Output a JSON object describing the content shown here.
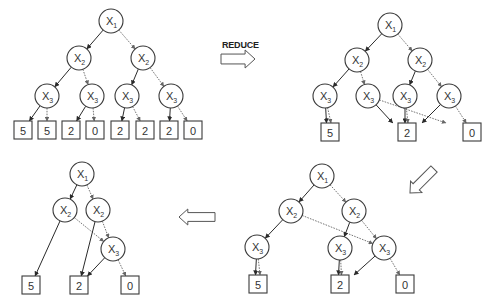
{
  "labels": {
    "reduce": "REDUCE"
  },
  "colors": {
    "stroke": "#3a3a3a",
    "dotted": "#666666",
    "background": "#ffffff"
  },
  "trees": [
    {
      "id": "original-tree",
      "nodes": [
        {
          "id": "a1",
          "var": "X",
          "sub": "1",
          "x": 111,
          "y": 21
        },
        {
          "id": "a2",
          "var": "X",
          "sub": "2",
          "x": 79,
          "y": 58
        },
        {
          "id": "a3",
          "var": "X",
          "sub": "2",
          "x": 143,
          "y": 58
        },
        {
          "id": "a4",
          "var": "X",
          "sub": "3",
          "x": 47,
          "y": 96
        },
        {
          "id": "a5",
          "var": "X",
          "sub": "3",
          "x": 92,
          "y": 96
        },
        {
          "id": "a6",
          "var": "X",
          "sub": "3",
          "x": 127,
          "y": 96
        },
        {
          "id": "a7",
          "var": "X",
          "sub": "3",
          "x": 171,
          "y": 96
        }
      ],
      "leaves": [
        {
          "id": "aL1",
          "value": "5",
          "x": 23,
          "y": 130
        },
        {
          "id": "aL2",
          "value": "5",
          "x": 47,
          "y": 130
        },
        {
          "id": "aL3",
          "value": "2",
          "x": 71,
          "y": 130
        },
        {
          "id": "aL4",
          "value": "0",
          "x": 95,
          "y": 130
        },
        {
          "id": "aL5",
          "value": "2",
          "x": 120,
          "y": 130
        },
        {
          "id": "aL6",
          "value": "2",
          "x": 145,
          "y": 130
        },
        {
          "id": "aL7",
          "value": "2",
          "x": 169,
          "y": 130
        },
        {
          "id": "aL8",
          "value": "0",
          "x": 193,
          "y": 130
        }
      ],
      "edges": [
        {
          "from": "a1",
          "to": "a2",
          "style": "solid"
        },
        {
          "from": "a1",
          "to": "a3",
          "style": "dotted"
        },
        {
          "from": "a2",
          "to": "a4",
          "style": "solid"
        },
        {
          "from": "a2",
          "to": "a5",
          "style": "dotted"
        },
        {
          "from": "a3",
          "to": "a6",
          "style": "solid"
        },
        {
          "from": "a3",
          "to": "a7",
          "style": "dotted"
        },
        {
          "from": "a4",
          "to": "aL1",
          "style": "solid"
        },
        {
          "from": "a4",
          "to": "aL2",
          "style": "dotted"
        },
        {
          "from": "a5",
          "to": "aL3",
          "style": "solid"
        },
        {
          "from": "a5",
          "to": "aL4",
          "style": "dotted"
        },
        {
          "from": "a6",
          "to": "aL5",
          "style": "solid"
        },
        {
          "from": "a6",
          "to": "aL6",
          "style": "dotted"
        },
        {
          "from": "a7",
          "to": "aL7",
          "style": "solid"
        },
        {
          "from": "a7",
          "to": "aL8",
          "style": "dotted"
        }
      ]
    },
    {
      "id": "merged-terminals-tree",
      "nodes": [
        {
          "id": "b1",
          "var": "X",
          "sub": "1",
          "x": 390,
          "y": 25
        },
        {
          "id": "b2",
          "var": "X",
          "sub": "2",
          "x": 357,
          "y": 60
        },
        {
          "id": "b3",
          "var": "X",
          "sub": "2",
          "x": 420,
          "y": 60
        },
        {
          "id": "b4",
          "var": "X",
          "sub": "3",
          "x": 325,
          "y": 96
        },
        {
          "id": "b5",
          "var": "X",
          "sub": "3",
          "x": 368,
          "y": 96
        },
        {
          "id": "b6",
          "var": "X",
          "sub": "3",
          "x": 405,
          "y": 96
        },
        {
          "id": "b7",
          "var": "X",
          "sub": "3",
          "x": 449,
          "y": 96
        }
      ],
      "leaves": [
        {
          "id": "bL1",
          "value": "5",
          "x": 330,
          "y": 132
        },
        {
          "id": "bL2",
          "value": "2",
          "x": 407,
          "y": 132
        },
        {
          "id": "bL3",
          "value": "0",
          "x": 472,
          "y": 132
        }
      ],
      "edges": [
        {
          "from": "b1",
          "to": "b2",
          "style": "solid"
        },
        {
          "from": "b1",
          "to": "b3",
          "style": "dotted"
        },
        {
          "from": "b2",
          "to": "b4",
          "style": "solid"
        },
        {
          "from": "b2",
          "to": "b5",
          "style": "dotted"
        },
        {
          "from": "b3",
          "to": "b6",
          "style": "solid"
        },
        {
          "from": "b3",
          "to": "b7",
          "style": "dotted"
        },
        {
          "from": "b4",
          "to": "bL1",
          "style": "solid",
          "dx": -3
        },
        {
          "from": "b4",
          "to": "bL1",
          "style": "dotted",
          "dx": 3
        },
        {
          "from": "b5",
          "to": "bL2",
          "style": "solid",
          "dx": -6
        },
        {
          "from": "b5",
          "to": "bL3",
          "style": "dotted"
        },
        {
          "from": "b6",
          "to": "bL2",
          "style": "solid",
          "dx": -2
        },
        {
          "from": "b6",
          "to": "bL2",
          "style": "dotted",
          "dx": 2
        },
        {
          "from": "b7",
          "to": "bL2",
          "style": "solid",
          "dx": 6
        },
        {
          "from": "b7",
          "to": "bL3",
          "style": "dotted"
        }
      ]
    },
    {
      "id": "merged-x3-tree",
      "nodes": [
        {
          "id": "c1",
          "var": "X",
          "sub": "1",
          "x": 322,
          "y": 176
        },
        {
          "id": "c2",
          "var": "X",
          "sub": "2",
          "x": 291,
          "y": 211
        },
        {
          "id": "c3",
          "var": "X",
          "sub": "2",
          "x": 354,
          "y": 211
        },
        {
          "id": "c4",
          "var": "X",
          "sub": "3",
          "x": 257,
          "y": 247
        },
        {
          "id": "c5",
          "var": "X",
          "sub": "3",
          "x": 340,
          "y": 248
        },
        {
          "id": "c6",
          "var": "X",
          "sub": "3",
          "x": 384,
          "y": 248
        }
      ],
      "leaves": [
        {
          "id": "cL1",
          "value": "5",
          "x": 258,
          "y": 284
        },
        {
          "id": "cL2",
          "value": "2",
          "x": 340,
          "y": 284
        },
        {
          "id": "cL3",
          "value": "0",
          "x": 405,
          "y": 284
        }
      ],
      "edges": [
        {
          "from": "c1",
          "to": "c2",
          "style": "solid"
        },
        {
          "from": "c1",
          "to": "c3",
          "style": "dotted"
        },
        {
          "from": "c2",
          "to": "c4",
          "style": "solid"
        },
        {
          "from": "c2",
          "to": "c6",
          "style": "dotted"
        },
        {
          "from": "c3",
          "to": "c5",
          "style": "solid"
        },
        {
          "from": "c3",
          "to": "c6",
          "style": "dotted"
        },
        {
          "from": "c4",
          "to": "cL1",
          "style": "solid",
          "dx": -3
        },
        {
          "from": "c4",
          "to": "cL1",
          "style": "dotted",
          "dx": 3
        },
        {
          "from": "c5",
          "to": "cL2",
          "style": "solid",
          "dx": -2
        },
        {
          "from": "c5",
          "to": "cL2",
          "style": "dotted",
          "dx": 2
        },
        {
          "from": "c6",
          "to": "cL2",
          "style": "solid",
          "dx": 4
        },
        {
          "from": "c6",
          "to": "cL3",
          "style": "dotted"
        }
      ]
    },
    {
      "id": "reduced-tree",
      "nodes": [
        {
          "id": "d1",
          "var": "X",
          "sub": "1",
          "x": 82,
          "y": 174
        },
        {
          "id": "d2",
          "var": "X",
          "sub": "2",
          "x": 65,
          "y": 210
        },
        {
          "id": "d3",
          "var": "X",
          "sub": "2",
          "x": 98,
          "y": 210
        },
        {
          "id": "d4",
          "var": "X",
          "sub": "3",
          "x": 113,
          "y": 249
        }
      ],
      "leaves": [
        {
          "id": "dL1",
          "value": "5",
          "x": 31,
          "y": 285
        },
        {
          "id": "dL2",
          "value": "2",
          "x": 79,
          "y": 285
        },
        {
          "id": "dL3",
          "value": "0",
          "x": 130,
          "y": 285
        }
      ],
      "edges": [
        {
          "from": "d1",
          "to": "d2",
          "style": "solid"
        },
        {
          "from": "d1",
          "to": "d3",
          "style": "dotted"
        },
        {
          "from": "d2",
          "to": "dL1",
          "style": "solid"
        },
        {
          "from": "d2",
          "to": "d4",
          "style": "dotted"
        },
        {
          "from": "d3",
          "to": "dL2",
          "style": "solid"
        },
        {
          "from": "d3",
          "to": "d4",
          "style": "dotted"
        },
        {
          "from": "d4",
          "to": "dL2",
          "style": "solid"
        },
        {
          "from": "d4",
          "to": "dL3",
          "style": "dotted"
        }
      ]
    }
  ],
  "arrows": [
    {
      "id": "arrow-reduce",
      "direction": "right",
      "x": 238,
      "y": 59,
      "w": 34,
      "h": 18
    },
    {
      "id": "arrow-down-left",
      "direction": "down-left",
      "x": 422,
      "y": 181,
      "w": 34,
      "h": 16
    },
    {
      "id": "arrow-left",
      "direction": "left",
      "x": 197,
      "y": 217,
      "w": 36,
      "h": 16
    }
  ],
  "geometry": {
    "node_radius": 12,
    "leaf_size": 18
  }
}
